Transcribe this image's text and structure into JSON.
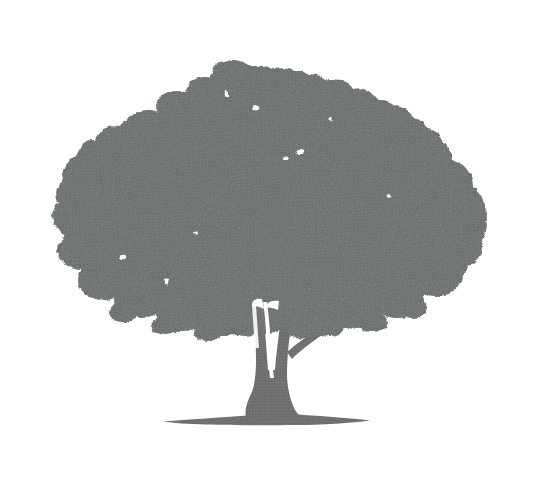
{
  "image": {
    "type": "illustration",
    "subject": "tree-silhouette",
    "description": "Silhouette of a broad-canopied deciduous tree with a short forked trunk standing on a thin flat ground line",
    "alt_text": "Gray silhouette of a wide spreading deciduous tree",
    "width": 535,
    "height": 489,
    "orientation": "landscape",
    "style": "flat halftone-textured silhouette on plain white background",
    "medium": "scanned print / halftone screen"
  },
  "colors": {
    "background": "#ffffff",
    "silhouette": "#737676",
    "silhouette_light": "#8a8d8d",
    "silhouette_dark": "#5f6262",
    "texture_speckle": "#5a5d5d"
  },
  "layout": {
    "canopy_bounds": {
      "left": 62,
      "right": 489,
      "top": 62,
      "bottom": 355
    },
    "trunk_bounds": {
      "left": 240,
      "right": 300,
      "top": 300,
      "bottom": 420
    },
    "ground_line": {
      "left": 163,
      "right": 370,
      "center_y": 420,
      "max_thickness": 9
    },
    "crown_peak": {
      "x": 232,
      "y": 64
    },
    "horizon_y": 423
  },
  "parts": [
    {
      "id": "canopy",
      "label": "Canopy",
      "note": "Large irregular lobed crown of foliage spanning most of the image width"
    },
    {
      "id": "trunk",
      "label": "Trunk",
      "note": "Short tapering trunk that forks into two limbs with a narrow vertical gap"
    },
    {
      "id": "branch-right",
      "label": "Right branch",
      "note": "Thin branch angling up and to the right from the trunk into the canopy"
    },
    {
      "id": "root-flare",
      "label": "Root flare",
      "note": "Trunk widens outward where it meets the ground"
    },
    {
      "id": "ground",
      "label": "Ground line",
      "note": "Thin lens-shaped shadow under the tree marking the ground plane"
    }
  ]
}
